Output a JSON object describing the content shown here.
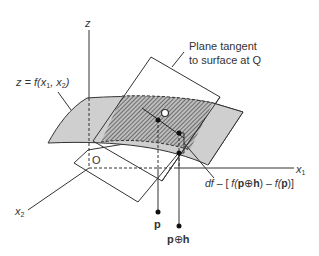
{
  "figure": {
    "axes": {
      "z_label": "z",
      "x1_label": "x",
      "x1_sub": "1",
      "x2_label": "x",
      "x2_sub": "2",
      "origin_label": "O"
    },
    "surface_label": {
      "prefix": "z = f(x",
      "sub1": "1",
      "mid": ", x",
      "sub2": "2",
      "suffix": ")"
    },
    "plane_label": {
      "line1": "Plane tangent",
      "line2": "to surface at Q"
    },
    "point_Q_label": "Q",
    "difference_label": {
      "df": "df",
      "dash": " – [ ",
      "f1": "f(",
      "p1": "p",
      "oplus": "⊕",
      "h": "h",
      "close1": ") – ",
      "f2": "f(",
      "p2": "p",
      "close2": ")]"
    },
    "point_p_label": "p",
    "point_ph_label": {
      "p": "p",
      "oplus": "⊕",
      "h": "h"
    },
    "colors": {
      "surface_fill": "#cfcfcf",
      "line": "#333333",
      "hatch_dark": "#555555"
    }
  }
}
